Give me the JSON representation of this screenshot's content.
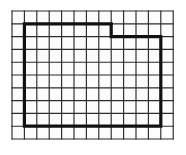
{
  "figure": {
    "name": "grid-with-outlined-region",
    "background_color": "#ffffff",
    "grid_line_color": "#2b2b2b",
    "outline_color": "#111111"
  },
  "chart_data": {
    "type": "diagram",
    "title": "",
    "subtitle": "",
    "xlabel": "",
    "ylabel": "",
    "grid": {
      "columns": 13,
      "rows": 10,
      "cell_width": 12.4,
      "cell_height": 12.8,
      "origin_x": 12,
      "origin_y": 11,
      "line_width": 1.15,
      "line_color": "#2b2b2b",
      "show_grid": true
    },
    "shapes": [
      {
        "name": "outlined-region",
        "kind": "polygon",
        "closed": true,
        "stroke_color": "#111111",
        "stroke_width": 3.2,
        "fill": "none",
        "grid_vertices": [
          [
            1,
            1
          ],
          [
            8,
            1
          ],
          [
            8,
            2
          ],
          [
            12,
            2
          ],
          [
            12,
            9
          ],
          [
            1,
            9
          ]
        ],
        "pixel_vertices": [
          [
            24.4,
            23.8
          ],
          [
            111.2,
            23.8
          ],
          [
            111.2,
            36.6
          ],
          [
            160.8,
            36.6
          ],
          [
            160.8,
            126.2
          ],
          [
            24.4,
            126.2
          ]
        ],
        "enclosed_cells": 90,
        "perimeter_cells": 40
      }
    ],
    "legend": {
      "show": false,
      "entries": []
    },
    "annotations": []
  }
}
